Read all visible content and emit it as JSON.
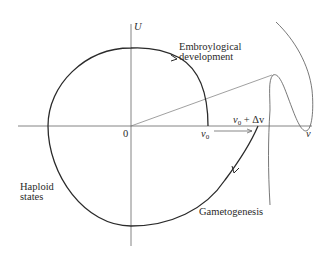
{
  "axes": {
    "y_label": "U",
    "x_label": "v",
    "origin_label": "0"
  },
  "markers": {
    "v0": "v",
    "v0_sub": "0",
    "v0_delta_prefix": "v",
    "v0_delta_sub": "0",
    "v0_delta_suffix": " + Δv"
  },
  "labels": {
    "embryo_line1": "Embroylogical",
    "embryo_line2": "development",
    "haploid_line1": "Haploid",
    "haploid_line2": "states",
    "gametogenesis": "Gametogenesis"
  },
  "colors": {
    "line": "#2a2a2a",
    "thin": "#555555"
  }
}
